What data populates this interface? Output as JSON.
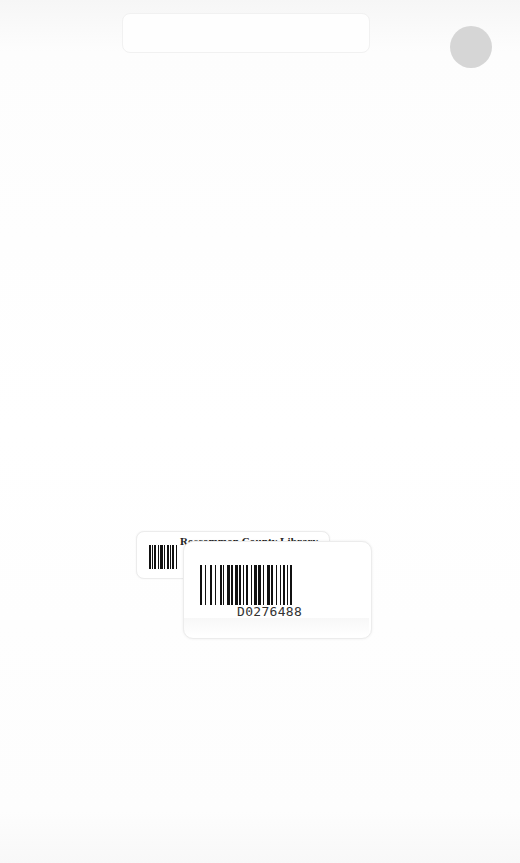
{
  "document": {
    "type": "book back cover",
    "library_label": {
      "library_name": "Roscommon County Library",
      "barcode_number": "D0276488"
    },
    "sticker_dot_color": "#d6d6d6"
  }
}
